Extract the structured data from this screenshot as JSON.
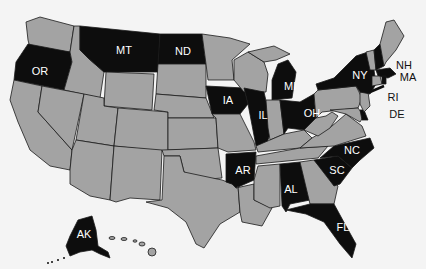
{
  "map": {
    "title": "",
    "colors": {
      "highlighted": "#0d0d0d",
      "other": "#a3a3a3",
      "border": "#1a1a1a",
      "background": "#f4f4f4",
      "label_inside": "#ffffff",
      "label_outside": "#111111"
    },
    "highlighted_states": [
      "OR",
      "MT",
      "ND",
      "IA",
      "IL",
      "MI",
      "OH",
      "NY",
      "NH",
      "MA",
      "RI",
      "DE",
      "NC",
      "SC",
      "AR",
      "AL",
      "FL",
      "AK"
    ],
    "labels": {
      "OR": "OR",
      "MT": "MT",
      "ND": "ND",
      "IA": "IA",
      "IL": "IL",
      "MI": "MI",
      "OH": "OH",
      "NY": "NY",
      "NH": "NH",
      "MA": "MA",
      "RI": "RI",
      "DE": "DE",
      "NC": "NC",
      "SC": "SC",
      "AR": "AR",
      "AL": "AL",
      "FL": "FL",
      "AK": "AK"
    }
  }
}
